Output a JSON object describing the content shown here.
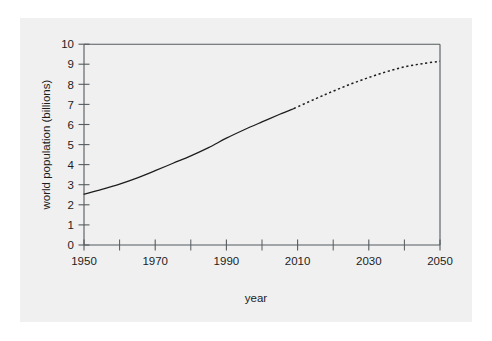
{
  "figure": {
    "background_color": "#ffffff",
    "panel_color": "#f0f0f0",
    "line_color": "#1d1d1d",
    "axis_color": "#555b5e"
  },
  "chart_data": {
    "type": "line",
    "title": "",
    "xlabel": "year",
    "ylabel": "world population (billions)",
    "xlim": [
      1950,
      2050
    ],
    "ylim": [
      0,
      10
    ],
    "grid": false,
    "legend": null,
    "xticks": [
      1950,
      1960,
      1970,
      1980,
      1990,
      2000,
      2010,
      2020,
      2030,
      2040,
      2050
    ],
    "xtick_labels": [
      "1950",
      "",
      "1970",
      "",
      "1990",
      "",
      "2010",
      "",
      "2030",
      "",
      "2050"
    ],
    "xtick_major_labels": [
      "1950",
      "1970",
      "1990",
      "2010",
      "2030",
      "2050"
    ],
    "yticks": [
      0,
      1,
      2,
      3,
      4,
      5,
      6,
      7,
      8,
      9,
      10
    ],
    "ytick_labels": [
      "0",
      "1",
      "2",
      "3",
      "4",
      "5",
      "6",
      "7",
      "8",
      "9",
      "10"
    ],
    "series": [
      {
        "name": "historical",
        "style": "solid",
        "x": [
          1950,
          1955,
          1960,
          1965,
          1970,
          1975,
          1980,
          1985,
          1990,
          1995,
          2000,
          2005,
          2009
        ],
        "values": [
          2.53,
          2.77,
          3.03,
          3.34,
          3.7,
          4.07,
          4.44,
          4.85,
          5.32,
          5.74,
          6.13,
          6.51,
          6.8
        ]
      },
      {
        "name": "projection",
        "style": "dotted",
        "x": [
          2009,
          2015,
          2020,
          2025,
          2030,
          2035,
          2040,
          2045,
          2050
        ],
        "values": [
          6.8,
          7.28,
          7.66,
          8.02,
          8.34,
          8.63,
          8.87,
          9.03,
          9.15
        ]
      }
    ],
    "annotations": [
      {
        "text": "solid line: historical estimates 1950-2009"
      },
      {
        "text": "dotted line: projection 2009-2050"
      }
    ]
  }
}
